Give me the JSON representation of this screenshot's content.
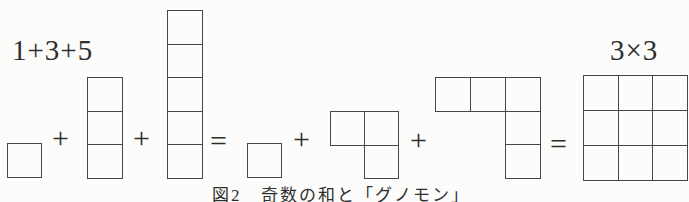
{
  "page": {
    "background": "#fcfcfb",
    "line_color": "#474747",
    "ink_color": "#2e2e2e"
  },
  "figure": {
    "left_expression": "1+3+5",
    "right_expression": "3×3",
    "caption": "図2　奇数の和と「グノモン」",
    "operators": [
      {
        "name": "plus-1",
        "glyph": "+",
        "x": 52,
        "y": 123
      },
      {
        "name": "plus-2",
        "glyph": "+",
        "x": 133,
        "y": 123
      },
      {
        "name": "equals-1",
        "glyph": "=",
        "x": 210,
        "y": 126
      },
      {
        "name": "plus-3",
        "glyph": "+",
        "x": 293,
        "y": 124
      },
      {
        "name": "plus-4",
        "glyph": "+",
        "x": 410,
        "y": 125
      },
      {
        "name": "equals-2",
        "glyph": "=",
        "x": 550,
        "y": 129
      }
    ],
    "shapes": [
      {
        "name": "unit-square-1",
        "x": 7,
        "y": 143,
        "cw": 35,
        "ch": 35,
        "cells": [
          [
            0,
            0
          ]
        ]
      },
      {
        "name": "column-of-3",
        "x": 87,
        "y": 77,
        "cw": 36,
        "ch": 34.7,
        "cells": [
          [
            0,
            0
          ],
          [
            0,
            1
          ],
          [
            0,
            2
          ]
        ]
      },
      {
        "name": "column-of-5",
        "x": 167,
        "y": 10,
        "cw": 36,
        "ch": 34.6,
        "cells": [
          [
            0,
            0
          ],
          [
            0,
            1
          ],
          [
            0,
            2
          ],
          [
            0,
            3
          ],
          [
            0,
            4
          ]
        ]
      },
      {
        "name": "unit-square-2",
        "x": 247,
        "y": 143,
        "cw": 35,
        "ch": 35,
        "cells": [
          [
            0,
            0
          ]
        ]
      },
      {
        "name": "l-tromino-of-3",
        "x": 330,
        "y": 111,
        "cw": 35,
        "ch": 34.5,
        "cells": [
          [
            0,
            0
          ],
          [
            1,
            0
          ],
          [
            1,
            1
          ]
        ]
      },
      {
        "name": "gnomon-of-5",
        "x": 435,
        "y": 77,
        "cw": 36,
        "ch": 34.7,
        "cells": [
          [
            0,
            0
          ],
          [
            1,
            0
          ],
          [
            2,
            0
          ],
          [
            2,
            1
          ],
          [
            2,
            2
          ]
        ]
      },
      {
        "name": "three-by-three-square",
        "x": 583,
        "y": 75,
        "cw": 35.7,
        "ch": 36,
        "cells": [
          [
            0,
            0
          ],
          [
            1,
            0
          ],
          [
            2,
            0
          ],
          [
            0,
            1
          ],
          [
            1,
            1
          ],
          [
            2,
            1
          ],
          [
            0,
            2
          ],
          [
            1,
            2
          ],
          [
            2,
            2
          ]
        ]
      }
    ]
  }
}
